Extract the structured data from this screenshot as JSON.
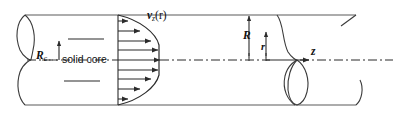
{
  "figure": {
    "type": "technical-diagram",
    "background_color": "#ffffff",
    "line_color": "#2b2b2b",
    "wall_color": "#4a4a4a",
    "text_color": "#111111",
    "canvas": {
      "width": 397,
      "height": 117
    }
  },
  "labels": {
    "core_radius": {
      "symbol": "R",
      "subscript": "c"
    },
    "solid_core": "solid core",
    "velocity_profile": {
      "symbol": "v",
      "subscript": "z",
      "argument": "(r)"
    },
    "pipe_radius": "R",
    "radial_coordinate": "r",
    "axial_coordinate": "z"
  },
  "geometry": {
    "pipe_top_wall_y": 15,
    "pipe_bottom_wall_y": 105,
    "centerline_y": 60,
    "pipe_left_x": 25,
    "pipe_right_x": 356,
    "profile_base_x": 118,
    "profile_max_x": 160,
    "core_top_y": 39,
    "core_bottom_y": 81,
    "velocity_arrow_count": 9,
    "centerline_style": "dash-dot",
    "break_style": "cutaway-loop"
  },
  "velocity_arrows": [
    {
      "y": 21,
      "length": 10
    },
    {
      "y": 31,
      "length": 22
    },
    {
      "y": 41,
      "length": 33
    },
    {
      "y": 50,
      "length": 40
    },
    {
      "y": 60,
      "length": 42
    },
    {
      "y": 70,
      "length": 40
    },
    {
      "y": 79,
      "length": 33
    },
    {
      "y": 89,
      "length": 22
    },
    {
      "y": 99,
      "length": 10
    }
  ]
}
